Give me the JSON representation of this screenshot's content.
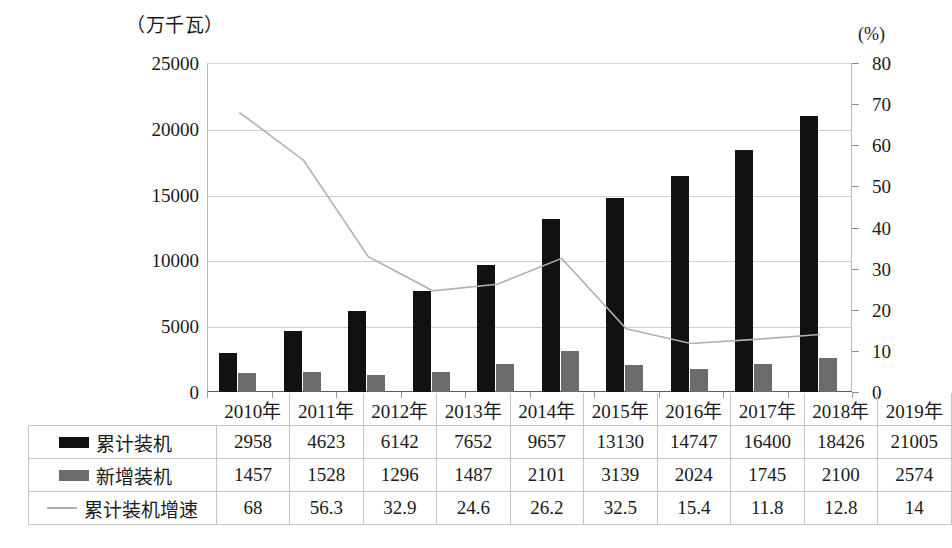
{
  "axes": {
    "left_unit": "（万千瓦）",
    "right_unit": "(%)",
    "left_ticks": [
      "0",
      "5000",
      "10000",
      "15000",
      "20000",
      "25000"
    ],
    "right_ticks": [
      "0",
      "10",
      "20",
      "30",
      "40",
      "50",
      "60",
      "70",
      "80"
    ]
  },
  "table": {
    "corner_label": "",
    "years": [
      "2010年",
      "2011年",
      "2012年",
      "2013年",
      "2014年",
      "2015年",
      "2016年",
      "2017年",
      "2018年",
      "2019年"
    ],
    "rows": [
      {
        "label": "累计装机",
        "marker": "black-square-swatch",
        "values": [
          "2958",
          "4623",
          "6142",
          "7652",
          "9657",
          "13130",
          "14747",
          "16400",
          "18426",
          "21005"
        ]
      },
      {
        "label": "新增装机",
        "marker": "gray-square-swatch",
        "values": [
          "1457",
          "1528",
          "1296",
          "1487",
          "2101",
          "3139",
          "2024",
          "1745",
          "2100",
          "2574"
        ]
      },
      {
        "label": "累计装机增速",
        "marker": "gray-line-swatch",
        "values": [
          "68",
          "56.3",
          "32.9",
          "24.6",
          "26.2",
          "32.5",
          "15.4",
          "11.8",
          "12.8",
          "14"
        ]
      }
    ]
  },
  "chart_data": {
    "type": "bar",
    "title": "",
    "xlabel": "",
    "ylabel": "（万千瓦）",
    "y2label": "(%)",
    "categories": [
      "2010年",
      "2011年",
      "2012年",
      "2013年",
      "2014年",
      "2015年",
      "2016年",
      "2017年",
      "2018年",
      "2019年"
    ],
    "ylim": [
      0,
      25000
    ],
    "y2lim": [
      0,
      80
    ],
    "grid": true,
    "legend_position": "table-left-column",
    "series": [
      {
        "name": "累计装机",
        "type": "bar",
        "axis": "left",
        "color": "#111111",
        "values": [
          2958,
          4623,
          6142,
          7652,
          9657,
          13130,
          14747,
          16400,
          18426,
          21005
        ]
      },
      {
        "name": "新增装机",
        "type": "bar",
        "axis": "left",
        "color": "#6b6b6b",
        "values": [
          1457,
          1528,
          1296,
          1487,
          2101,
          3139,
          2024,
          1745,
          2100,
          2574
        ]
      },
      {
        "name": "累计装机增速",
        "type": "line",
        "axis": "right",
        "color": "#b0b0b0",
        "values": [
          68,
          56.3,
          32.9,
          24.6,
          26.2,
          32.5,
          15.4,
          11.8,
          12.8,
          14
        ]
      }
    ]
  }
}
